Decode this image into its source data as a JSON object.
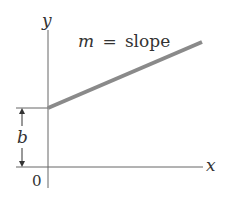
{
  "diagram": {
    "type": "line-graph",
    "axes": {
      "x_label": "x",
      "y_label": "y",
      "origin_label": "0"
    },
    "line": {
      "annotation": "m = slope",
      "slope_symbol": "m",
      "equals": "=",
      "slope_word": "slope",
      "color": "#8a8a8a"
    },
    "intercept": {
      "label": "b"
    },
    "colors": {
      "axis": "#666666",
      "text": "#333333"
    }
  }
}
